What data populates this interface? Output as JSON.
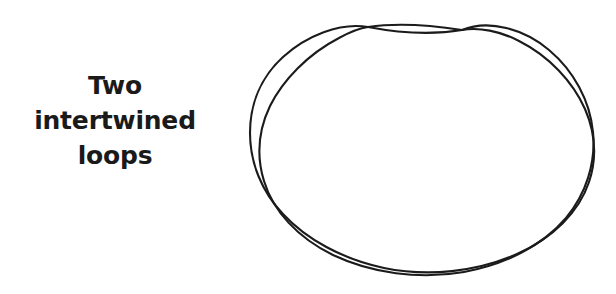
{
  "page": {
    "title": "Two intertwined loops",
    "background_color": "#ffffff",
    "width": 616,
    "height": 294,
    "ink_color": "#1b1b1b",
    "text_color": "#1a1a1a"
  },
  "caption": {
    "full_text": "Two intertwined loops",
    "align": "center",
    "lines": [
      {
        "text": "Two"
      },
      {
        "text": "intertwined"
      },
      {
        "text": "loops"
      }
    ]
  },
  "figure": {
    "name": "two-intertwined-loops-diagram",
    "stroke_width": 2.1,
    "loop_count": 2,
    "crossings": [
      {
        "label": "top-left-crossing",
        "x": 368,
        "y": 27
      },
      {
        "label": "top-right-crossing",
        "x": 462,
        "y": 30
      }
    ],
    "bounds": {
      "left": 249,
      "top": 11,
      "right": 594,
      "bottom": 279
    },
    "loops": [
      {
        "name": "outer-loop",
        "path": "M 368 27 C 340 22 306 36 283 57 C 261 77 250 104 250 133 C 250 163 262 192 283 214 C 306 239 342 259 384 268 C 428 277 477 272 517 254 C 553 238 579 212 589 182 C 597 158 595 132 585 109 C 573 82 549 56 519 41 C 500 31 479 27 462 30 C 438 34 410 35 368 27 Z"
      },
      {
        "name": "inner-loop",
        "path": "M 462 30 C 489 19 524 29 549 50 C 574 71 590 101 593 132 C 596 163 586 194 566 218 C 543 245 507 264 464 272 C 419 280 371 273 333 255 C 298 238 273 211 264 181 C 256 155 259 129 270 106 C 283 80 308 54 339 38 C 350 32 360 28 368 27 C 395 23 430 25 462 30 Z"
      }
    ]
  }
}
